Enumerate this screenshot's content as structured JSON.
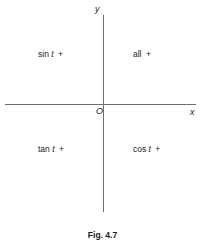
{
  "figure": {
    "caption": "Fig. 4.7",
    "axes": {
      "y_label": "y",
      "x_label": "x",
      "origin_label": "O"
    },
    "quadrants": [
      {
        "name": "second",
        "func": "sin",
        "var": "t",
        "sign": "+",
        "text": "sin t +"
      },
      {
        "name": "first",
        "func": "all",
        "var": "",
        "sign": "+",
        "text": "all +"
      },
      {
        "name": "third",
        "func": "tan",
        "var": "t",
        "sign": "+",
        "text": "tan t +"
      },
      {
        "name": "fourth",
        "func": "cos",
        "var": "t",
        "sign": "+",
        "text": "cos t +"
      }
    ]
  },
  "chart_data": {
    "type": "scatter",
    "title": "Fig. 4.7",
    "xlabel": "x",
    "ylabel": "y",
    "xlim": [
      -1,
      1
    ],
    "ylim": [
      -1,
      1
    ],
    "grid": false,
    "legend": null,
    "annotations": [
      {
        "text": "sin t +",
        "x": -0.55,
        "y": 0.55,
        "quadrant": 2
      },
      {
        "text": "all +",
        "x": 0.45,
        "y": 0.55,
        "quadrant": 1
      },
      {
        "text": "tan t +",
        "x": -0.55,
        "y": -0.45,
        "quadrant": 3
      },
      {
        "text": "cos t +",
        "x": 0.45,
        "y": -0.45,
        "quadrant": 4
      },
      {
        "text": "O",
        "x": -0.04,
        "y": -0.04,
        "quadrant": 0
      }
    ],
    "series": []
  }
}
